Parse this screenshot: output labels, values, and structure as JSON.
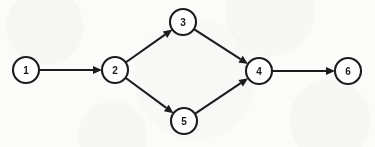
{
  "diagram": {
    "type": "directed-graph",
    "background_color": "#fbfbfa",
    "stroke_color": "#1c1c1c",
    "node_fill_color": "#ffffff",
    "label_color": "#1a1a1a",
    "node_radius": 13,
    "arrowhead_length": 9,
    "arrowhead_width": 8,
    "nodes": [
      {
        "id": "1",
        "label": "1",
        "cx": 26,
        "cy": 70
      },
      {
        "id": "2",
        "label": "2",
        "cx": 115,
        "cy": 70
      },
      {
        "id": "3",
        "label": "3",
        "cx": 183,
        "cy": 22
      },
      {
        "id": "4",
        "label": "4",
        "cx": 259,
        "cy": 71
      },
      {
        "id": "5",
        "label": "5",
        "cx": 184,
        "cy": 121
      },
      {
        "id": "6",
        "label": "6",
        "cx": 348,
        "cy": 71
      }
    ],
    "edges": [
      {
        "id": "e1",
        "from": "1",
        "to": "2",
        "directed": true
      },
      {
        "id": "e2",
        "from": "2",
        "to": "3",
        "directed": true
      },
      {
        "id": "e3",
        "from": "2",
        "to": "5",
        "directed": true
      },
      {
        "id": "e4",
        "from": "3",
        "to": "4",
        "directed": true
      },
      {
        "id": "e5",
        "from": "5",
        "to": "4",
        "directed": true
      },
      {
        "id": "e6",
        "from": "4",
        "to": "6",
        "directed": true
      }
    ]
  }
}
